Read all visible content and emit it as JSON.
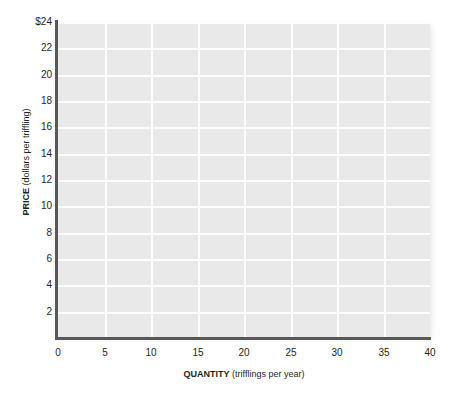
{
  "chart_data": {
    "type": "line",
    "title": "",
    "subtitle": "",
    "xlabel_bold": "QUANTITY",
    "xlabel_rest": " (trifflings per year)",
    "ylabel_bold": "PRICE",
    "ylabel_rest": " (dollars per triffling)",
    "xlim": [
      0,
      40
    ],
    "ylim": [
      0,
      24
    ],
    "xticks": [
      0,
      5,
      10,
      15,
      20,
      25,
      30,
      35,
      40
    ],
    "xtick_labels": [
      "0",
      "5",
      "10",
      "15",
      "20",
      "25",
      "30",
      "35",
      "40"
    ],
    "yticks": [
      2,
      4,
      6,
      8,
      10,
      12,
      14,
      16,
      18,
      20,
      22,
      24
    ],
    "ytick_labels": [
      "2",
      "4",
      "6",
      "8",
      "10",
      "12",
      "14",
      "16",
      "18",
      "20",
      "22",
      "$24"
    ],
    "grid": true,
    "grid_color": "#fdfdfd",
    "plot_background": "#e9e9e9",
    "axis_color": "#58585a",
    "page_background": "#ffffff",
    "legend": null,
    "legend_position": "none",
    "series": [],
    "annotations": [],
    "note": "Empty grid template with no plotted data series"
  }
}
